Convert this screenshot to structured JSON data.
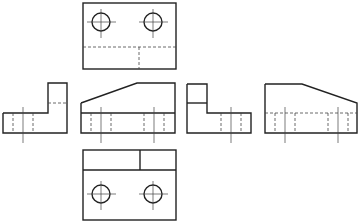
{
  "figure": {
    "type": "orthographic-projection-views",
    "views": [
      {
        "name": "top-view",
        "label": ""
      },
      {
        "name": "left-side-view",
        "label": ""
      },
      {
        "name": "front-view",
        "label": ""
      },
      {
        "name": "right-side-view",
        "label": ""
      },
      {
        "name": "rear-view",
        "label": ""
      },
      {
        "name": "bottom-view",
        "label": ""
      }
    ],
    "colors": {
      "line": "#222222",
      "background": "#ffffff"
    }
  }
}
